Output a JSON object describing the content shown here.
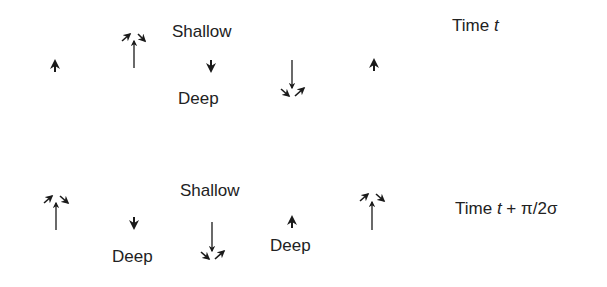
{
  "diagram": {
    "rows": [
      {
        "time_label": "Time",
        "time_var": "t",
        "time_suffix": "",
        "labels": [
          {
            "text": "Shallow",
            "x": 172,
            "y": 22
          },
          {
            "text": "Deep",
            "x": 178,
            "y": 88
          }
        ],
        "arrows": [
          {
            "kind": "small-up",
            "x": 55,
            "y": 66
          },
          {
            "kind": "upwelling",
            "x": 134,
            "y": 68
          },
          {
            "kind": "small-down",
            "x": 211,
            "y": 64
          },
          {
            "kind": "downwelling",
            "x": 292,
            "y": 60
          },
          {
            "kind": "small-up",
            "x": 374,
            "y": 65
          }
        ]
      },
      {
        "time_label": "Time",
        "time_var": "t",
        "time_suffix": " + π/2σ",
        "labels": [
          {
            "text": "Shallow",
            "x": 180,
            "y": 181
          },
          {
            "text": "Deep",
            "x": 112,
            "y": 246
          },
          {
            "text": "Deep",
            "x": 270,
            "y": 236
          }
        ],
        "arrows": [
          {
            "kind": "upwelling",
            "x": 56,
            "y": 230
          },
          {
            "kind": "small-down",
            "x": 134,
            "y": 222
          },
          {
            "kind": "downwelling",
            "x": 212,
            "y": 222
          },
          {
            "kind": "small-up",
            "x": 292,
            "y": 222
          },
          {
            "kind": "upwelling",
            "x": 372,
            "y": 230
          }
        ]
      }
    ],
    "text": {
      "row1_time": "Time",
      "row1_var": "t",
      "row2_time": "Time",
      "row2_var": "t",
      "row2_suffix": "+ π/2σ",
      "shallow_1": "Shallow",
      "deep_1": "Deep",
      "shallow_2": "Shallow",
      "deep_2a": "Deep",
      "deep_2b": "Deep"
    },
    "colors": {
      "ink": "#1a1a1a",
      "background": "#ffffff"
    }
  }
}
